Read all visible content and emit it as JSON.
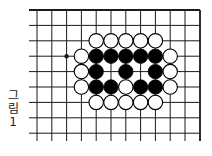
{
  "figure": {
    "caption_chars": [
      "그",
      "림",
      "1"
    ],
    "caption": "그림 1"
  },
  "board": {
    "columns_x": [
      37,
      51.8,
      66.6,
      81.4,
      96.2,
      111,
      125.8,
      140.6,
      155.4,
      170.2,
      185,
      200
    ],
    "rows_y": [
      10,
      25.4,
      40.8,
      56.2,
      71.6,
      87,
      102.4,
      117.8,
      133.2
    ],
    "line_left_extent": 29,
    "line_bottom_extent": 141,
    "top_edge": true,
    "right_edge": true,
    "stone_radius": 7.2,
    "line_color": "#1a1a1a",
    "black_color": "#000000",
    "white_color": "#ffffff",
    "hoshi": [
      {
        "col": 2,
        "row": 3
      }
    ],
    "stones": [
      {
        "col": 4,
        "row": 2,
        "color": "white"
      },
      {
        "col": 5,
        "row": 2,
        "color": "white"
      },
      {
        "col": 6,
        "row": 2,
        "color": "white"
      },
      {
        "col": 7,
        "row": 2,
        "color": "white"
      },
      {
        "col": 8,
        "row": 2,
        "color": "white"
      },
      {
        "col": 3,
        "row": 3,
        "color": "white"
      },
      {
        "col": 4,
        "row": 3,
        "color": "black"
      },
      {
        "col": 5,
        "row": 3,
        "color": "black"
      },
      {
        "col": 6,
        "row": 3,
        "color": "black"
      },
      {
        "col": 7,
        "row": 3,
        "color": "black"
      },
      {
        "col": 8,
        "row": 3,
        "color": "black"
      },
      {
        "col": 9,
        "row": 3,
        "color": "white"
      },
      {
        "col": 3,
        "row": 4,
        "color": "white"
      },
      {
        "col": 4,
        "row": 4,
        "color": "black"
      },
      {
        "col": 6,
        "row": 4,
        "color": "black"
      },
      {
        "col": 8,
        "row": 4,
        "color": "black"
      },
      {
        "col": 9,
        "row": 4,
        "color": "white"
      },
      {
        "col": 3,
        "row": 5,
        "color": "white"
      },
      {
        "col": 4,
        "row": 5,
        "color": "black"
      },
      {
        "col": 5,
        "row": 5,
        "color": "black"
      },
      {
        "col": 6,
        "row": 5,
        "color": "white"
      },
      {
        "col": 7,
        "row": 5,
        "color": "black"
      },
      {
        "col": 8,
        "row": 5,
        "color": "black"
      },
      {
        "col": 9,
        "row": 5,
        "color": "white"
      },
      {
        "col": 4,
        "row": 6,
        "color": "white"
      },
      {
        "col": 5,
        "row": 6,
        "color": "white"
      },
      {
        "col": 6,
        "row": 6,
        "color": "white"
      },
      {
        "col": 7,
        "row": 6,
        "color": "white"
      },
      {
        "col": 8,
        "row": 6,
        "color": "white"
      }
    ]
  }
}
